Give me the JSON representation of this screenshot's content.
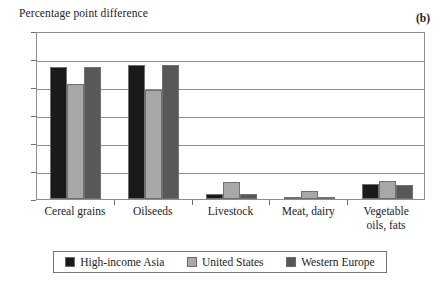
{
  "figure": {
    "panel_letter": "(b)",
    "axis_title": "Percentage point difference"
  },
  "legend": {
    "items": [
      {
        "label": "High-income Asia",
        "color": "#1a1a1a"
      },
      {
        "label": "United States",
        "color": "#a8a8a8"
      },
      {
        "label": "Western Europe",
        "color": "#585858"
      }
    ]
  },
  "yaxis": {
    "ticks": [
      "0",
      "2",
      "4",
      "6",
      "8",
      "10",
      "12"
    ]
  },
  "chart_data": {
    "type": "bar",
    "title": "Percentage point difference",
    "xlabel": "",
    "ylabel": "Percentage point difference",
    "ylim": [
      0,
      12
    ],
    "yticks": [
      0,
      2,
      4,
      6,
      8,
      10,
      12
    ],
    "grid": true,
    "legend_position": "bottom",
    "annotations": [
      "(b)"
    ],
    "categories": [
      "Cereal grains",
      "Oilseeds",
      "Livestock",
      "Meat, dairy",
      "Vegetable oils, fats"
    ],
    "category_lines": [
      [
        "Cereal grains"
      ],
      [
        "Oilseeds"
      ],
      [
        "Livestock"
      ],
      [
        "Meat, dairy"
      ],
      [
        "Vegetable",
        "oils, fats"
      ]
    ],
    "series": [
      {
        "name": "High-income Asia",
        "color": "#1a1a1a",
        "values": [
          9.4,
          9.6,
          0.35,
          0.12,
          1.05
        ]
      },
      {
        "name": "United States",
        "color": "#a8a8a8",
        "values": [
          8.2,
          7.8,
          1.25,
          0.6,
          1.3
        ]
      },
      {
        "name": "Western Europe",
        "color": "#585858",
        "values": [
          9.4,
          9.6,
          0.35,
          0.12,
          1.0
        ]
      }
    ]
  }
}
